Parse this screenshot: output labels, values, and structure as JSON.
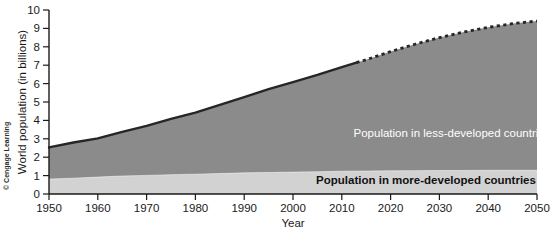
{
  "chart_data": {
    "type": "area",
    "title": "",
    "xlabel": "Year",
    "ylabel": "World population (in billions)",
    "xlim": [
      1950,
      2050
    ],
    "ylim": [
      0,
      10
    ],
    "grid": false,
    "stacked": true,
    "legend_position": "inside-plot",
    "x": [
      1950,
      1955,
      1960,
      1965,
      1970,
      1975,
      1980,
      1985,
      1990,
      1995,
      2000,
      2005,
      2010,
      2015,
      2020,
      2025,
      2030,
      2035,
      2040,
      2045,
      2050
    ],
    "xticks": [
      "1950",
      "1960",
      "1970",
      "1980",
      "1990",
      "2000",
      "2010",
      "2020",
      "2030",
      "2040",
      "2050"
    ],
    "yticks": [
      "0",
      "1",
      "2",
      "3",
      "4",
      "5",
      "6",
      "7",
      "8",
      "9",
      "10"
    ],
    "projection_starts_at": 2013,
    "series": [
      {
        "name": "Population in more-developed countries",
        "color": "#d2d2d2",
        "values": [
          0.81,
          0.86,
          0.92,
          0.98,
          1.01,
          1.05,
          1.08,
          1.11,
          1.15,
          1.17,
          1.19,
          1.21,
          1.24,
          1.25,
          1.26,
          1.27,
          1.28,
          1.28,
          1.29,
          1.29,
          1.29
        ]
      },
      {
        "name": "Population in less-developed countries",
        "color": "#8b8b8b",
        "values": [
          1.72,
          1.94,
          2.1,
          2.4,
          2.69,
          3.03,
          3.34,
          3.73,
          4.12,
          4.53,
          4.89,
          5.26,
          5.66,
          6.05,
          6.48,
          6.87,
          7.22,
          7.52,
          7.77,
          7.97,
          8.11
        ]
      }
    ],
    "totals": [
      2.53,
      2.8,
      3.02,
      3.38,
      3.7,
      4.08,
      4.42,
      4.84,
      5.27,
      5.7,
      6.08,
      6.47,
      6.9,
      7.3,
      7.74,
      8.14,
      8.5,
      8.8,
      9.06,
      9.26,
      9.4
    ],
    "annotations": [
      {
        "text": "Population in less-developed countries",
        "x": 2019,
        "y": 4.6,
        "style": "light"
      },
      {
        "text": "Population in more-developed countries",
        "x": 2019,
        "y": 0.55,
        "style": "dark"
      }
    ],
    "credit": "© Cengage Learning"
  }
}
